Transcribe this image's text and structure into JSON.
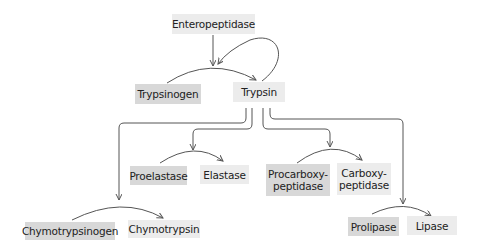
{
  "diagram": {
    "activator": "Enteropeptidase",
    "trypsin_pair": {
      "zymogen": "Trypsinogen",
      "enzyme": "Trypsin"
    },
    "pairs": [
      {
        "zymogen": "Chymotrypsinogen",
        "enzyme": "Chymotrypsin"
      },
      {
        "zymogen": "Proelastase",
        "enzyme": "Elastase"
      },
      {
        "zymogen": "Procarboxy-\npeptidase",
        "enzyme": "Carboxy-\npeptidase"
      },
      {
        "zymogen": "Prolipase",
        "enzyme": "Lipase"
      }
    ],
    "colors": {
      "zymogen_box": "#d8d8d8",
      "enzyme_box": "#ececec",
      "line": "#555555"
    }
  }
}
